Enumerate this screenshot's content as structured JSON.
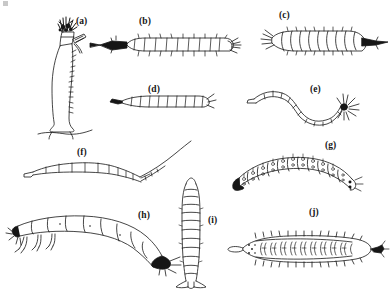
{
  "figure": {
    "background_color": "#ffffff",
    "ink_color": "#161616",
    "width": 391,
    "height": 296
  },
  "specimens": [
    {
      "id": "a",
      "label": "(a)",
      "label_x": 76,
      "label_y": 17,
      "name": "upright-elongate-larva-on-substrate",
      "orientation": "vertical",
      "description": "Tall upright grub-like larva with bristly head tuft at top, short oblique projection on upper right, resting on a ground line"
    },
    {
      "id": "b",
      "label": "(b)",
      "label_x": 139,
      "label_y": 17,
      "name": "segmented-larva-dark-head-left",
      "orientation": "horizontal",
      "description": "Cylindrical segmented larva, dark sclerotised head capsule at left, short setae along both margins, paired terminal projections at right"
    },
    {
      "id": "c",
      "label": "(c)",
      "label_x": 279,
      "label_y": 11,
      "name": "stout-segmented-larva-dark-tail-right",
      "orientation": "horizontal",
      "description": "Stout barrel-segmented larva with fringed anterior at left and a dark pointed caudal process at right"
    },
    {
      "id": "d",
      "label": "(d)",
      "label_x": 148,
      "label_y": 85,
      "name": "slender-tapering-larva",
      "orientation": "horizontal",
      "description": "Slender, lightly segmented tapering larva with a small dark head at left and a short forked tip at right"
    },
    {
      "id": "e",
      "label": "(e)",
      "label_x": 310,
      "label_y": 85,
      "name": "sinuous-aquatic-larva-with-terminal-fan",
      "orientation": "horizontal-sinuous",
      "description": "S-curved worm-like larva of beaded segments ending in a dark knob bearing a radiating fan of setae at right"
    },
    {
      "id": "f",
      "label": "(f)",
      "label_x": 77,
      "label_y": 148,
      "name": "slender-larva-with-long-caudal-filament",
      "orientation": "horizontal",
      "description": "Slender segmented larva whose posterior end narrows into a long, straight upward-trailing caudal filament"
    },
    {
      "id": "g",
      "label": "(g)",
      "label_x": 325,
      "label_y": 141,
      "name": "arched-larva-with-patterned-segments",
      "orientation": "horizontal-arched",
      "description": "Arched caterpillar-like larva with boxy segments each carrying paired spot-and-seta markings, dark head at left"
    },
    {
      "id": "h",
      "label": "(h)",
      "label_x": 138,
      "label_y": 211,
      "name": "large-curved-larva-with-thoracic-legs",
      "orientation": "horizontal-curved",
      "description": "Large curved larva with distinct thoracic legs at the left end and a dark swollen terminal segment at right"
    },
    {
      "id": "i",
      "label": "(i)",
      "label_x": 208,
      "label_y": 216,
      "name": "vertical-ringed-larva",
      "orientation": "vertical",
      "description": "Narrow, vertically oriented larva of stacked ring-like segments with a splayed terminal pad at the base"
    },
    {
      "id": "j",
      "label": "(j)",
      "label_x": 309,
      "label_y": 208,
      "name": "flattened-larva-with-lateral-spines",
      "orientation": "horizontal",
      "description": "Dorsally flattened larva outlined with lateral spines; interior filled with dense paired hook-like markings, dark tail knob at right"
    }
  ]
}
